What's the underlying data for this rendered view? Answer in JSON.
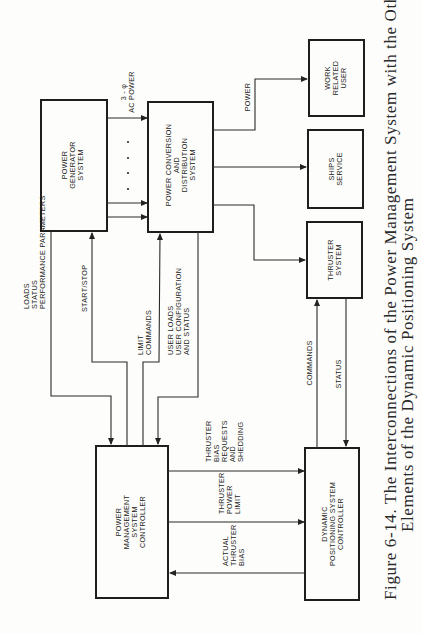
{
  "figure": {
    "caption_line1": "Figure 6-14.  The Interconnections of the Power Management System with the Other",
    "caption_line2": "Elements of the Dynamic Positioning System"
  },
  "blocks": {
    "power_generator": [
      "POWER",
      "GENERATOR",
      "SYSTEM"
    ],
    "power_conversion": [
      "POWER CONVERSION",
      "AND",
      "DISTRIBUTION",
      "SYSTEM"
    ],
    "work_related_user": [
      "WORK",
      "RELATED",
      "USER"
    ],
    "ships_service": [
      "SHIPS",
      "SERVICE"
    ],
    "thruster_system": [
      "THRUSTER",
      "SYSTEM"
    ],
    "pms_controller": [
      "POWER",
      "MANAGEMENT",
      "SYSTEM",
      "CONTROLLER"
    ],
    "dps_controller": [
      "DYNAMIC",
      "POSITIONING SYSTEM",
      "CONTROLLER"
    ]
  },
  "signals": {
    "ac_power": [
      "3 - φ",
      "AC POWER"
    ],
    "power": [
      "POWER"
    ],
    "loads_status": [
      "LOADS",
      "STATUS",
      "PERFORMANCE PARAMETERS"
    ],
    "start_stop": [
      "START/STOP"
    ],
    "limit_commands": [
      "LIMIT",
      "COMMANDS"
    ],
    "user_loads": [
      "USER LOADS",
      "USER CONFIGURATION",
      "AND STATUS"
    ],
    "commands": [
      "COMMANDS"
    ],
    "status": [
      "STATUS"
    ],
    "thruster_bias_requests": [
      "THRUSTER",
      "BIAS",
      "REQUESTS",
      "AND",
      "SHEDDING"
    ],
    "thruster_power_limit": [
      "THRUSTER",
      "POWER",
      "LIMIT"
    ],
    "actual_thruster_bias": [
      "ACTUAL",
      "THRUSTER",
      "BIAS"
    ]
  }
}
